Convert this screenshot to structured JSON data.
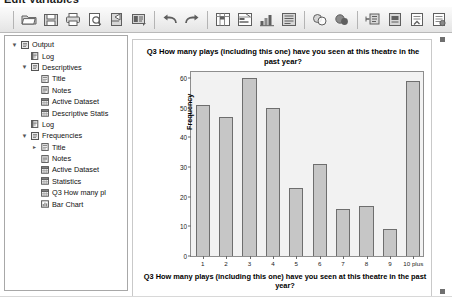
{
  "window": {
    "title": "Edit Variables"
  },
  "toolbar": {
    "buttons": [
      {
        "name": "open-file-icon",
        "label": "Open"
      },
      {
        "name": "save-icon",
        "label": "Save"
      },
      {
        "name": "print-icon",
        "label": "Print"
      },
      {
        "name": "print-preview-icon",
        "label": "Print Preview"
      },
      {
        "name": "export-icon",
        "label": "Export"
      },
      {
        "name": "dialog-recall-icon",
        "label": "Recall Dialogs"
      },
      {
        "name": "undo-icon",
        "label": "Undo"
      },
      {
        "name": "redo-icon",
        "label": "Redo"
      },
      {
        "name": "goto-case-icon",
        "label": "Go To Case"
      },
      {
        "name": "variables-icon",
        "label": "Variables"
      },
      {
        "name": "run-descriptives-icon",
        "label": "Run Descriptive Statistics"
      },
      {
        "name": "find-icon",
        "label": "Find"
      },
      {
        "name": "insert-cases-icon",
        "label": "Insert Cases"
      },
      {
        "name": "insert-variable-icon",
        "label": "Insert Variable"
      },
      {
        "name": "split-file-icon",
        "label": "Split File"
      },
      {
        "name": "weight-cases-icon",
        "label": "Weight Cases"
      },
      {
        "name": "select-cases-icon",
        "label": "Select Cases"
      },
      {
        "name": "value-labels-icon",
        "label": "Value Labels"
      },
      {
        "name": "use-variable-sets-icon",
        "label": "Use Variable Sets"
      },
      {
        "name": "collapse-panel-icon",
        "label": "Collapse"
      }
    ]
  },
  "outline": {
    "name": "output-navigator",
    "nodes": [
      {
        "label": "Output",
        "depth": 0,
        "twisty": "down",
        "icon": "output-icon"
      },
      {
        "label": "Log",
        "depth": 1,
        "twisty": "none",
        "icon": "log-icon"
      },
      {
        "label": "Descriptives",
        "depth": 1,
        "twisty": "down",
        "icon": "output-icon"
      },
      {
        "label": "Title",
        "depth": 2,
        "twisty": "none",
        "icon": "title-icon"
      },
      {
        "label": "Notes",
        "depth": 2,
        "twisty": "none",
        "icon": "notes-icon"
      },
      {
        "label": "Active Dataset",
        "depth": 2,
        "twisty": "none",
        "icon": "table-icon"
      },
      {
        "label": "Descriptive Statis",
        "depth": 2,
        "twisty": "none",
        "icon": "table-icon"
      },
      {
        "label": "Log",
        "depth": 1,
        "twisty": "none",
        "icon": "log-icon"
      },
      {
        "label": "Frequencies",
        "depth": 1,
        "twisty": "down",
        "icon": "output-icon"
      },
      {
        "label": "Title",
        "depth": 2,
        "twisty": "right",
        "icon": "title-icon"
      },
      {
        "label": "Notes",
        "depth": 2,
        "twisty": "none",
        "icon": "notes-icon"
      },
      {
        "label": "Active Dataset",
        "depth": 2,
        "twisty": "none",
        "icon": "table-icon"
      },
      {
        "label": "Statistics",
        "depth": 2,
        "twisty": "none",
        "icon": "table-icon"
      },
      {
        "label": "Q3 How many pl",
        "depth": 2,
        "twisty": "none",
        "icon": "table-icon"
      },
      {
        "label": "Bar Chart",
        "depth": 2,
        "twisty": "none",
        "icon": "chart-icon"
      }
    ]
  },
  "chart_data": {
    "type": "bar",
    "title": "Q3 How many plays (including this one) have you seen at this theatre in the past year?",
    "xlabel": "Q3 How many plays (including this one) have you seen at this theatre in the past year?",
    "ylabel": "Frequency",
    "categories": [
      "1",
      "2",
      "3",
      "4",
      "5",
      "6",
      "7",
      "8",
      "9",
      "10 plus"
    ],
    "values": [
      51,
      47,
      60,
      50,
      23,
      31,
      16,
      17,
      9,
      59
    ],
    "ylim": [
      0,
      62
    ],
    "yticks": [
      0,
      10,
      20,
      30,
      40,
      50,
      60
    ],
    "grid": false,
    "legend": "none",
    "bar_fill": "#c6c6c6",
    "bar_border": "#6e6e6e",
    "plot_background": "#f2f2f2"
  }
}
